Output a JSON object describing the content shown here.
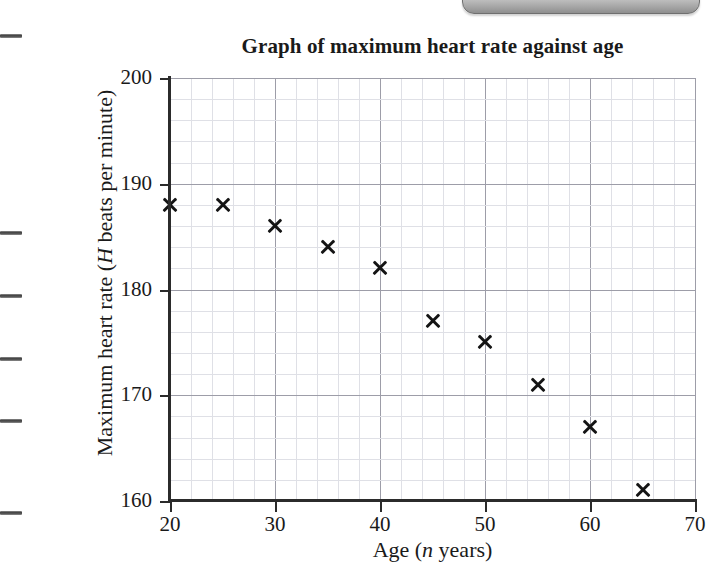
{
  "chart_data": {
    "type": "scatter",
    "title": "Graph of maximum heart rate against age",
    "xlabel": "Age (n years)",
    "ylabel": "Maximum heart rate (H beats per minute)",
    "xlabel_parts": {
      "prefix": "Age (",
      "italic": "n",
      "suffix": " years)"
    },
    "ylabel_parts": {
      "prefix": "Maximum heart rate (",
      "italic": "H",
      "suffix": " beats per minute)"
    },
    "x": [
      20,
      25,
      30,
      35,
      40,
      45,
      50,
      55,
      60,
      65
    ],
    "values": [
      188,
      188,
      186,
      184,
      182,
      177,
      175,
      171,
      167,
      161
    ],
    "points": [
      {
        "x": 20,
        "y": 188
      },
      {
        "x": 25,
        "y": 188
      },
      {
        "x": 30,
        "y": 186
      },
      {
        "x": 35,
        "y": 184
      },
      {
        "x": 40,
        "y": 182
      },
      {
        "x": 45,
        "y": 177
      },
      {
        "x": 50,
        "y": 175
      },
      {
        "x": 55,
        "y": 171
      },
      {
        "x": 60,
        "y": 167
      },
      {
        "x": 65,
        "y": 161
      }
    ],
    "xlim": [
      20,
      70
    ],
    "ylim": [
      160,
      200
    ],
    "xticks": [
      20,
      30,
      40,
      50,
      60,
      70
    ],
    "yticks": [
      160,
      170,
      180,
      190,
      200
    ],
    "x_minor_step": 2,
    "y_minor_step": 2,
    "grid": true,
    "legend": null,
    "marker": "x",
    "marker_color": "#141414",
    "major_grid_color": "#9d9da8",
    "minor_grid_color": "#dfe0e6",
    "axis_color": "#2b2b2b"
  },
  "page_artifacts": {
    "margin_marks_y": [
      34,
      231,
      294,
      357,
      419,
      511
    ],
    "corner_tab_label": ""
  }
}
